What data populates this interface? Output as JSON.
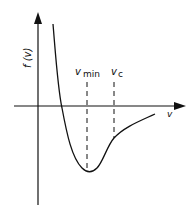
{
  "diagram": {
    "y_axis_label": "f (v)",
    "x_axis_label": "v",
    "markers": [
      {
        "symbol": "v",
        "subscript": "min"
      },
      {
        "symbol": "v",
        "subscript": "c"
      }
    ],
    "stroke_color": "#111111",
    "background": "#ffffff"
  }
}
